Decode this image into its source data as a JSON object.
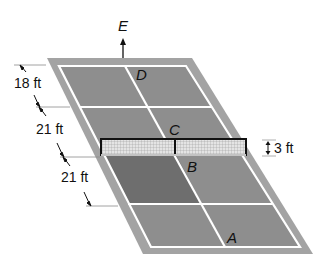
{
  "diagram": {
    "type": "tennis-court-perspective",
    "colors": {
      "outer": "#9a9a9a",
      "court": "#8c8c8c",
      "shaded_quadrant": "#6f6f6f",
      "lines": "#ffffff",
      "net_fill": "#dcdcdc",
      "net_frame": "#111111"
    },
    "points": {
      "A": "A",
      "B": "B",
      "C": "C",
      "D": "D",
      "E": "E"
    },
    "dimensions": {
      "d1": "18 ft",
      "d2": "21 ft",
      "d3": "21 ft",
      "net_height": "3 ft"
    }
  }
}
